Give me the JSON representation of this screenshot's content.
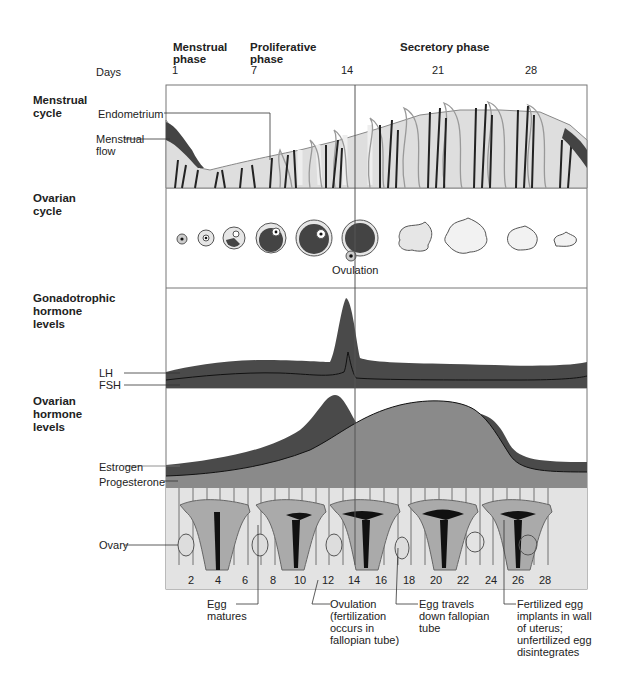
{
  "header": {
    "phases": [
      {
        "label": "Menstrual\nphase"
      },
      {
        "label": "Proliferative\nphase"
      },
      {
        "label": "Secretory phase"
      }
    ],
    "days_label": "Days",
    "day_ticks": [
      "1",
      "7",
      "14",
      "21",
      "28"
    ]
  },
  "sections": {
    "menstrual": {
      "title": "Menstrual\ncycle",
      "labels": {
        "endometrium": "Endometrium",
        "flow": "Menstrual\nflow"
      }
    },
    "ovarian": {
      "title": "Ovarian\ncycle",
      "labels": {
        "ovulation": "Ovulation"
      }
    },
    "gonadotropic": {
      "title": "Gonadotrophic\nhormone\nlevels",
      "labels": {
        "lh": "LH",
        "fsh": "FSH"
      }
    },
    "ovarian_hormone": {
      "title": "Ovarian\nhormone\nlevels",
      "labels": {
        "estrogen": "Estrogen",
        "progesterone": "Progesterone"
      }
    },
    "uterus": {
      "labels": {
        "ovary": "Ovary"
      },
      "day_numbers": [
        "2",
        "4",
        "6",
        "8",
        "10",
        "12",
        "14",
        "16",
        "18",
        "20",
        "22",
        "24",
        "26",
        "28"
      ]
    }
  },
  "callouts": [
    {
      "text": "Egg\nmatures"
    },
    {
      "text": "Ovulation\n(fertilization\noccurs in\nfallopian tube)"
    },
    {
      "text": "Egg travels\ndown fallopian\ntube"
    },
    {
      "text": "Fertilized egg\nimplants in wall\nof uterus;\nunfertilized egg\ndisintegrates"
    }
  ],
  "colors": {
    "dark": "#4a4a4a",
    "mid": "#8a8a8a",
    "light": "#d8d8d8",
    "frame": "#666666"
  }
}
